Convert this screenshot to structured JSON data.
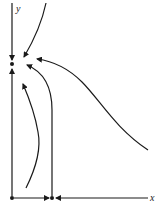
{
  "diagram": {
    "type": "phase-portrait",
    "axes": {
      "x_label": "x",
      "y_label": "y"
    },
    "fixed_points": [
      {
        "name": "origin",
        "x": 12,
        "y": 198
      },
      {
        "name": "on-y-axis",
        "x": 12,
        "y": 64
      },
      {
        "name": "on-x-axis",
        "x": 52,
        "y": 198
      }
    ],
    "colors": {
      "stroke": "#1a1a1a",
      "background": "#ffffff"
    }
  }
}
